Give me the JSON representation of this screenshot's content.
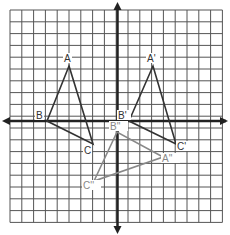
{
  "diagram": {
    "type": "coordinate-grid-transformations",
    "grid": {
      "left": 10,
      "top": 10,
      "cell": 11.8,
      "cols": 18,
      "rows": 18,
      "color": "#555555"
    },
    "axes": {
      "origin_x": 117.5,
      "origin_y": 121,
      "color": "#222222"
    },
    "triangles": [
      {
        "name": "ABC",
        "color": "#333333",
        "vertices": [
          {
            "label": "A",
            "x": 69,
            "y": 66,
            "lx": 64,
            "ly": 62
          },
          {
            "label": "B",
            "x": 47,
            "y": 121,
            "lx": 36,
            "ly": 119
          },
          {
            "label": "C",
            "x": 93,
            "y": 144,
            "lx": 84,
            "ly": 154
          }
        ]
      },
      {
        "name": "A'B'C'",
        "color": "#333333",
        "vertices": [
          {
            "label": "A'",
            "x": 153,
            "y": 66,
            "lx": 147,
            "ly": 62
          },
          {
            "label": "B'",
            "x": 129,
            "y": 121,
            "lx": 118,
            "ly": 119
          },
          {
            "label": "C'",
            "x": 176,
            "y": 144,
            "lx": 177,
            "ly": 150
          }
        ]
      },
      {
        "name": "A''B''C''",
        "color": "#888888",
        "vertices": [
          {
            "label": "A''",
            "x": 163,
            "y": 157,
            "lx": 162,
            "ly": 162
          },
          {
            "label": "B''",
            "x": 117,
            "y": 132,
            "lx": 110,
            "ly": 130
          },
          {
            "label": "C''",
            "x": 94,
            "y": 181,
            "lx": 83,
            "ly": 189
          }
        ]
      }
    ]
  }
}
